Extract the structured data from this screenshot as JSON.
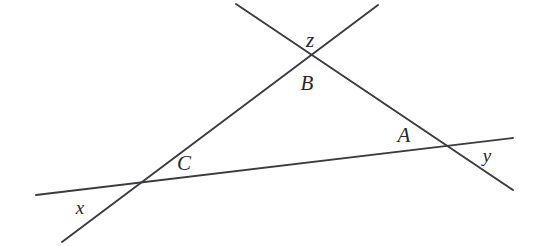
{
  "figure": {
    "name": "three-intersecting-lines-triangle",
    "width": 542,
    "height": 246,
    "background_color": "#ffffff",
    "line_color": "#3a3a3f",
    "label_color": "#27272b"
  },
  "lines": [
    {
      "id": "line-x",
      "name": "line-x",
      "label": "x",
      "description": "ascending line from lower-left to upper-right",
      "x1": 62,
      "y1": 242,
      "x2": 378,
      "y2": 5
    },
    {
      "id": "line-y",
      "name": "line-y",
      "label": "y",
      "description": "near-horizontal line from left to right",
      "x1": 36,
      "y1": 195,
      "x2": 513,
      "y2": 138
    },
    {
      "id": "line-z",
      "name": "line-z",
      "label": "z",
      "description": "descending line from upper-left to lower-right",
      "x1": 236,
      "y1": 4,
      "x2": 513,
      "y2": 190
    }
  ],
  "intersections": [
    {
      "id": "vertex-B",
      "name": "vertex-b",
      "label": "B",
      "x": 313,
      "y": 58,
      "lines": [
        "line-x",
        "line-z"
      ]
    },
    {
      "id": "vertex-C",
      "name": "vertex-c",
      "label": "C",
      "x": 132,
      "y": 185,
      "lines": [
        "line-x",
        "line-y"
      ]
    },
    {
      "id": "vertex-A",
      "name": "vertex-a",
      "label": "A",
      "x": 447,
      "y": 144,
      "lines": [
        "line-y",
        "line-z"
      ]
    }
  ],
  "labels": [
    {
      "id": "label-z",
      "name": "label-z",
      "text": "z",
      "x": 310,
      "y": 40,
      "size": "upper"
    },
    {
      "id": "label-B",
      "name": "label-b",
      "text": "B",
      "x": 307,
      "y": 83,
      "size": "upper"
    },
    {
      "id": "label-A",
      "name": "label-a",
      "text": "A",
      "x": 404,
      "y": 135,
      "size": "upper"
    },
    {
      "id": "label-C",
      "name": "label-c",
      "text": "C",
      "x": 184,
      "y": 163,
      "size": "upper"
    },
    {
      "id": "label-y",
      "name": "label-y",
      "text": "y",
      "x": 487,
      "y": 155,
      "size": "lower"
    },
    {
      "id": "label-x",
      "name": "label-x",
      "text": "x",
      "x": 80,
      "y": 207,
      "size": "lower"
    }
  ]
}
